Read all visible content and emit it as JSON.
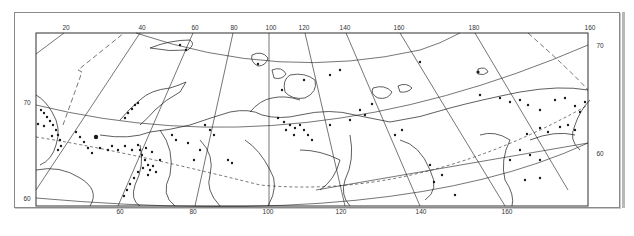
{
  "map": {
    "region": "Northern Eurasia / Russian Arctic",
    "colors": {
      "ink": "#1a1a1a",
      "frame": "#8a8a8a",
      "background": "#ffffff"
    },
    "top_longitude_labels": [
      {
        "text": "20",
        "x": 66
      },
      {
        "text": "40",
        "x": 142
      },
      {
        "text": "60",
        "x": 195
      },
      {
        "text": "80",
        "x": 234
      },
      {
        "text": "100",
        "x": 271
      },
      {
        "text": "120",
        "x": 304
      },
      {
        "text": "140",
        "x": 345
      },
      {
        "text": "160",
        "x": 399
      },
      {
        "text": "180",
        "x": 474
      },
      {
        "text": "160",
        "x": 590
      }
    ],
    "bottom_longitude_labels": [
      {
        "text": "60",
        "x": 120
      },
      {
        "text": "80",
        "x": 193
      },
      {
        "text": "100",
        "x": 268
      },
      {
        "text": "120",
        "x": 341
      },
      {
        "text": "140",
        "x": 421
      },
      {
        "text": "160",
        "x": 507
      }
    ],
    "left_latitude_labels": [
      {
        "text": "70",
        "y": 103
      },
      {
        "text": "60",
        "y": 199
      }
    ],
    "right_latitude_labels": [
      {
        "text": "70",
        "y": 46
      },
      {
        "text": "60",
        "y": 154
      }
    ],
    "legend": null
  }
}
